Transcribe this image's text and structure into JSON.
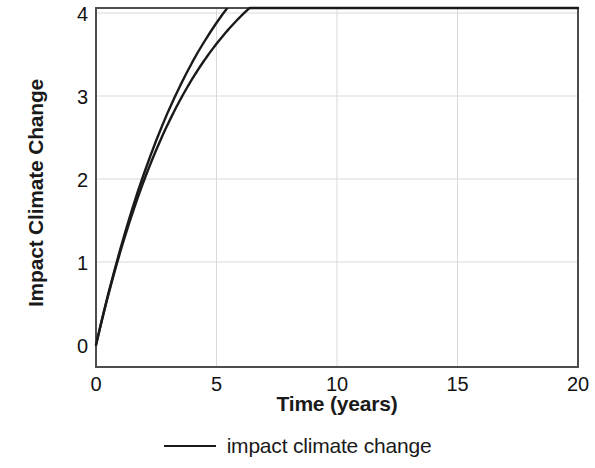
{
  "chart_data": {
    "type": "line",
    "title": "",
    "xlabel": "Time (years)",
    "ylabel": "Impact Climate Change",
    "xlim": [
      0,
      20
    ],
    "ylim": [
      -0.25,
      4.2
    ],
    "xticks": [
      0,
      5,
      10,
      15,
      20
    ],
    "yticks": [
      0,
      1,
      2,
      3,
      4
    ],
    "xtick_labels": [
      "0",
      "5",
      "10",
      "15",
      "20"
    ],
    "ytick_labels": [
      "0",
      "1",
      "2",
      "3",
      "4"
    ],
    "grid": true,
    "grid_color": "#d9d9d9",
    "legend_position": "bottom-center",
    "line_color": "#1a1a1a",
    "frame_color": "#555555",
    "series": [
      {
        "name": "impact climate change",
        "x": [
          0,
          0.25,
          0.5,
          0.75,
          1,
          1.25,
          1.5,
          1.75,
          2,
          2.25,
          2.5,
          2.75,
          3,
          3.25,
          3.5,
          3.75,
          4,
          4.5,
          5,
          5.5,
          6,
          6.5,
          7,
          7.5,
          8,
          8.5,
          9,
          9.5,
          10,
          11,
          12,
          13,
          14,
          15,
          16,
          17,
          18,
          19,
          20
        ],
        "y": [
          0,
          0.31,
          0.61,
          0.89,
          1.16,
          1.41,
          1.66,
          1.89,
          2.11,
          2.31,
          2.51,
          2.7,
          2.87,
          3.04,
          3.2,
          3.34,
          3.48,
          3.72,
          3.93,
          4.1,
          4.25,
          4.38,
          4.49,
          4.58,
          4.67,
          4.74,
          4.8,
          4.85,
          4.9,
          4.97,
          5.02,
          5.06,
          5.08,
          5.1,
          5.11,
          5.12,
          5.13,
          5.13,
          5.13
        ]
      }
    ],
    "model": {
      "form": "y = A * (1 - exp(-t / tau))",
      "A": 5.15,
      "tau": 4.1,
      "asymptote_display": 4.15
    }
  },
  "legend": {
    "entries": [
      {
        "label": "impact climate change",
        "swatch": "line-swatch"
      }
    ]
  },
  "axes": {
    "x_title": "Time (years)",
    "y_title": "Impact Climate Change"
  }
}
